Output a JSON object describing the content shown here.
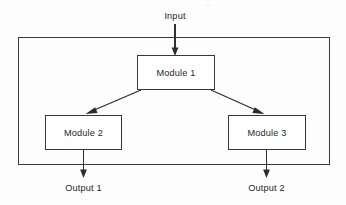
{
  "diagram": {
    "type": "block-diagram",
    "container": {
      "name": "system-boundary",
      "x": 18,
      "y": 37,
      "width": 312,
      "height": 128
    },
    "nodes": [
      {
        "id": "module-1",
        "label": "Module 1",
        "x": 137,
        "y": 55,
        "width": 78,
        "height": 35
      },
      {
        "id": "module-2",
        "label": "Module 2",
        "x": 45,
        "y": 115,
        "width": 77,
        "height": 35
      },
      {
        "id": "module-3",
        "label": "Module 3",
        "x": 228,
        "y": 115,
        "width": 78,
        "height": 35
      }
    ],
    "ports": [
      {
        "id": "input",
        "label": "Input",
        "x": 175,
        "y": 16,
        "direction": "in"
      },
      {
        "id": "output-1",
        "label": "Output 1",
        "x": 83,
        "y": 188,
        "direction": "out"
      },
      {
        "id": "output-2",
        "label": "Output 2",
        "x": 266,
        "y": 188,
        "direction": "out"
      }
    ],
    "edges": [
      {
        "id": "edge-input-module1",
        "from": "input",
        "to": "module-1",
        "kind": "vertical"
      },
      {
        "id": "edge-module1-module2",
        "from": "module-1",
        "to": "module-2",
        "kind": "diagonal"
      },
      {
        "id": "edge-module1-module3",
        "from": "module-1",
        "to": "module-3",
        "kind": "diagonal"
      },
      {
        "id": "edge-module2-output1",
        "from": "module-2",
        "to": "output-1",
        "kind": "vertical"
      },
      {
        "id": "edge-module3-output2",
        "from": "module-3",
        "to": "output-2",
        "kind": "vertical"
      }
    ],
    "colors": {
      "line": "#303030",
      "box_fill": "#ffffff",
      "text": "#1f1f1f",
      "background": "#fdfdfd"
    }
  }
}
